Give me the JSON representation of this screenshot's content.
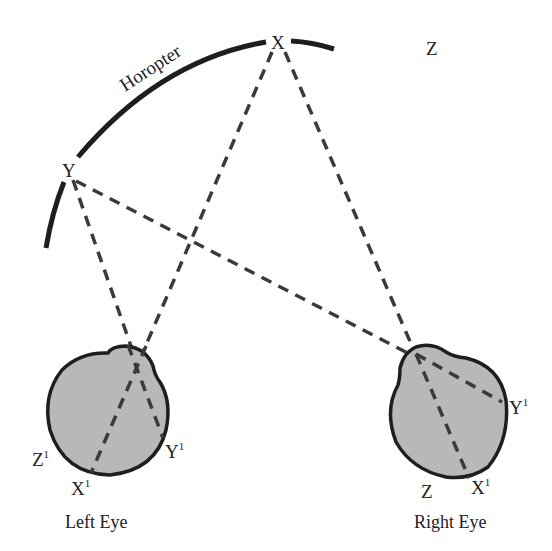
{
  "colors": {
    "ink": "#1e1e1e",
    "dash": "#3a3a3a",
    "eye_fill": "#b8b8b8",
    "background": "#ffffff"
  },
  "horopter": {
    "label": "Horopter"
  },
  "points": {
    "X": {
      "label": "X"
    },
    "Y": {
      "label": "Y"
    },
    "Z": {
      "label": "Z"
    }
  },
  "left_eye": {
    "caption": "Left Eye",
    "retina_labels": {
      "Z": {
        "base": "Z",
        "sup": "1"
      },
      "X": {
        "base": "X",
        "sup": "1"
      },
      "Y": {
        "base": "Y",
        "sup": "1"
      }
    }
  },
  "right_eye": {
    "caption": "Right Eye",
    "retina_labels": {
      "Z": {
        "base": "Z",
        "sup": ""
      },
      "X": {
        "base": "X",
        "sup": "1"
      },
      "Y": {
        "base": "Y",
        "sup": "1"
      }
    }
  }
}
